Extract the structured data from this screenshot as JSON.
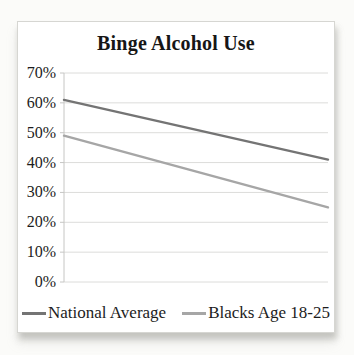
{
  "chart_data": {
    "type": "line",
    "title": "Binge Alcohol Use",
    "categories": [
      "",
      ""
    ],
    "series": [
      {
        "name": "National Average",
        "values": [
          61,
          41
        ],
        "color": "#747474"
      },
      {
        "name": "Blacks Age 18-25",
        "values": [
          49,
          25
        ],
        "color": "#a6a6a6"
      }
    ],
    "ylim": [
      0,
      70
    ],
    "yticks": [
      0,
      10,
      20,
      30,
      40,
      50,
      60,
      70
    ],
    "ytick_labels": [
      "0%",
      "10%",
      "20%",
      "30%",
      "40%",
      "50%",
      "60%",
      "70%"
    ],
    "xlabel": "",
    "ylabel": "",
    "grid": true,
    "legend_position": "bottom"
  },
  "colors": {
    "gridline": "#dcdcda",
    "axis": "#c6c6c4",
    "text": "#1c1c1c",
    "chart_border": "#d6d6d2",
    "background": "#ffffff"
  }
}
